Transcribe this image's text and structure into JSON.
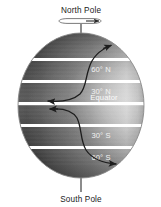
{
  "figure": {
    "type": "earth-rotation-coriolis-diagram",
    "background_color": "#ffffff"
  },
  "axis": {
    "north_pole_label": "North Pole",
    "south_pole_label": "South Pole",
    "rotation_indicator": "rotation-arrow-ellipse",
    "line_color": "#555555"
  },
  "globe": {
    "shading": "sphere-gradient",
    "dark_color": "#4a4a4a",
    "light_color": "#e8e8e8",
    "outline_color": "#7a7a7a",
    "band_color": "#ffffff"
  },
  "latitudes": [
    {
      "id": "lat-60n",
      "label": "60° N"
    },
    {
      "id": "lat-30n",
      "label": "30° N"
    },
    {
      "id": "lat-equator",
      "label": "Equator"
    },
    {
      "id": "lat-30s",
      "label": "30° S"
    },
    {
      "id": "lat-60s",
      "label": "60° S"
    }
  ],
  "deflection_arrows": [
    {
      "id": "arrow-northern",
      "description": "northern-hemisphere-deflection"
    },
    {
      "id": "arrow-southern",
      "description": "southern-hemisphere-deflection"
    }
  ]
}
